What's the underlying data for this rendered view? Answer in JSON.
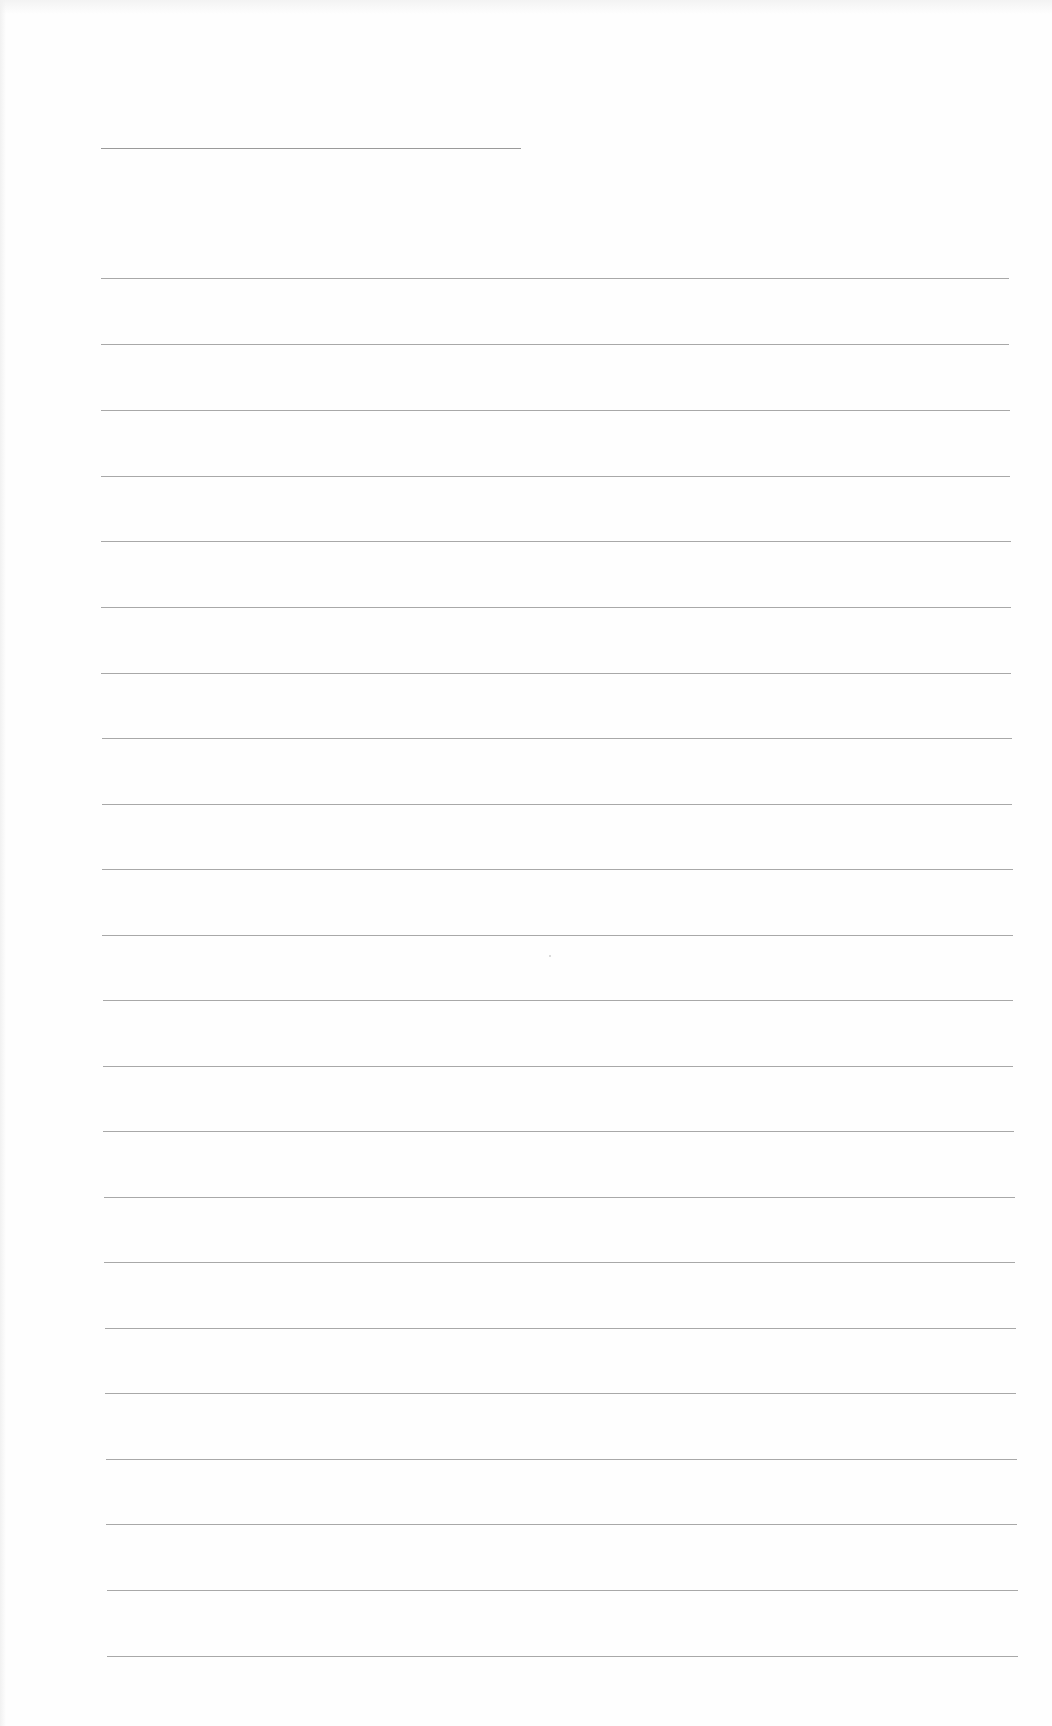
{
  "document": {
    "type": "blank lined page",
    "title_line": {
      "left": 101,
      "top": 148,
      "width": 420
    },
    "rules": [
      {
        "top": 278,
        "left": 101,
        "width": 908
      },
      {
        "top": 344,
        "left": 101,
        "width": 908
      },
      {
        "top": 410,
        "left": 101,
        "width": 909
      },
      {
        "top": 476,
        "left": 101,
        "width": 909
      },
      {
        "top": 541,
        "left": 101,
        "width": 910
      },
      {
        "top": 607,
        "left": 101,
        "width": 910
      },
      {
        "top": 673,
        "left": 101,
        "width": 910
      },
      {
        "top": 738,
        "left": 102,
        "width": 910
      },
      {
        "top": 804,
        "left": 102,
        "width": 910
      },
      {
        "top": 869,
        "left": 102,
        "width": 911
      },
      {
        "top": 935,
        "left": 102,
        "width": 911
      },
      {
        "top": 1000,
        "left": 103,
        "width": 910
      },
      {
        "top": 1066,
        "left": 103,
        "width": 910
      },
      {
        "top": 1131,
        "left": 103,
        "width": 911
      },
      {
        "top": 1197,
        "left": 104,
        "width": 911
      },
      {
        "top": 1262,
        "left": 104,
        "width": 911
      },
      {
        "top": 1328,
        "left": 105,
        "width": 911
      },
      {
        "top": 1393,
        "left": 105,
        "width": 911
      },
      {
        "top": 1459,
        "left": 106,
        "width": 911
      },
      {
        "top": 1524,
        "left": 106,
        "width": 911
      },
      {
        "top": 1590,
        "left": 107,
        "width": 911
      },
      {
        "top": 1656,
        "left": 107,
        "width": 911
      }
    ],
    "colors": {
      "paper": "#fefefe",
      "rule": "#a8a8a8",
      "title_rule": "#9a9a9a"
    }
  }
}
